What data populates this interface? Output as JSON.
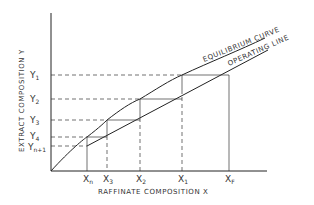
{
  "diagram": {
    "x_axis_label": "RAFFINATE COMPOSITION  X",
    "y_axis_label": "EXTRACT COMPOSITION  Y",
    "curve_labels": {
      "equilibrium": "EQUILIBRIUM CURVE",
      "operating": "OPERATING LINE"
    },
    "x_ticks": [
      {
        "base": "X",
        "sub": "n"
      },
      {
        "base": "X",
        "sub": "3"
      },
      {
        "base": "X",
        "sub": "2"
      },
      {
        "base": "X",
        "sub": "1"
      },
      {
        "base": "X",
        "sub": "F"
      }
    ],
    "y_ticks": [
      {
        "base": "Y",
        "sub": "1"
      },
      {
        "base": "Y",
        "sub": "2"
      },
      {
        "base": "Y",
        "sub": "3"
      },
      {
        "base": "Y",
        "sub": "4"
      },
      {
        "base": "Y",
        "sub": "n+1"
      }
    ]
  }
}
